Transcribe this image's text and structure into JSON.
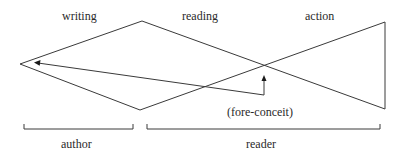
{
  "diagram": {
    "top_labels": {
      "writing": "writing",
      "reading": "reading",
      "action": "action"
    },
    "annotation": "(fore-conceit)",
    "bracket_labels": {
      "author": "author",
      "reader": "reader"
    },
    "stroke_color": "#3a3a3a",
    "text_color": "#2a2a2a"
  }
}
